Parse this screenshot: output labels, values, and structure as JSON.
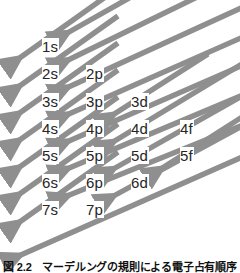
{
  "figure": {
    "title_caption": "図 2.2　マーデルングの規則による電子占有順序",
    "arrow_color": "#8f8f8f",
    "label_color": "#262626",
    "background_color": "#ffffff"
  },
  "chart_data": {
    "type": "diagram",
    "columns": [
      "s",
      "p",
      "d",
      "f"
    ],
    "rows": [
      1,
      2,
      3,
      4,
      5,
      6,
      7
    ],
    "orbitals": [
      {
        "label": "1s",
        "n": 1,
        "l": "s",
        "col": 0,
        "row": 0,
        "x": 42,
        "y": 38
      },
      {
        "label": "2s",
        "n": 2,
        "l": "s",
        "col": 0,
        "row": 1,
        "x": 42,
        "y": 65
      },
      {
        "label": "2p",
        "n": 2,
        "l": "p",
        "col": 1,
        "row": 1,
        "x": 86,
        "y": 65
      },
      {
        "label": "3s",
        "n": 3,
        "l": "s",
        "col": 0,
        "row": 2,
        "x": 42,
        "y": 93
      },
      {
        "label": "3p",
        "n": 3,
        "l": "p",
        "col": 1,
        "row": 2,
        "x": 86,
        "y": 93
      },
      {
        "label": "3d",
        "n": 3,
        "l": "d",
        "col": 2,
        "row": 2,
        "x": 131,
        "y": 93
      },
      {
        "label": "4s",
        "n": 4,
        "l": "s",
        "col": 0,
        "row": 3,
        "x": 42,
        "y": 120
      },
      {
        "label": "4p",
        "n": 4,
        "l": "p",
        "col": 1,
        "row": 3,
        "x": 86,
        "y": 120
      },
      {
        "label": "4d",
        "n": 4,
        "l": "d",
        "col": 2,
        "row": 3,
        "x": 131,
        "y": 120
      },
      {
        "label": "4f",
        "n": 4,
        "l": "f",
        "col": 3,
        "row": 3,
        "x": 180,
        "y": 120
      },
      {
        "label": "5s",
        "n": 5,
        "l": "s",
        "col": 0,
        "row": 4,
        "x": 42,
        "y": 147
      },
      {
        "label": "5p",
        "n": 5,
        "l": "p",
        "col": 1,
        "row": 4,
        "x": 86,
        "y": 147
      },
      {
        "label": "5d",
        "n": 5,
        "l": "d",
        "col": 2,
        "row": 4,
        "x": 131,
        "y": 147
      },
      {
        "label": "5f",
        "n": 5,
        "l": "f",
        "col": 3,
        "row": 4,
        "x": 180,
        "y": 147
      },
      {
        "label": "6s",
        "n": 6,
        "l": "s",
        "col": 0,
        "row": 5,
        "x": 42,
        "y": 174
      },
      {
        "label": "6p",
        "n": 6,
        "l": "p",
        "col": 1,
        "row": 5,
        "x": 86,
        "y": 174
      },
      {
        "label": "6d",
        "n": 6,
        "l": "d",
        "col": 2,
        "row": 5,
        "x": 131,
        "y": 174
      },
      {
        "label": "7s",
        "n": 7,
        "l": "s",
        "col": 0,
        "row": 6,
        "x": 42,
        "y": 201
      },
      {
        "label": "7p",
        "n": 7,
        "l": "p",
        "col": 1,
        "row": 6,
        "x": 86,
        "y": 201
      }
    ],
    "arrows": [
      {
        "name": "arrow-1s",
        "x1": 200,
        "y1": -42,
        "x2": 62,
        "y2": 36
      },
      {
        "name": "arrow-2s",
        "x1": 118,
        "y1": -12,
        "x2": 14,
        "y2": 62
      },
      {
        "name": "arrow-2p-2s",
        "x1": 228,
        "y1": -18,
        "x2": 62,
        "y2": 63
      },
      {
        "name": "arrow-3s",
        "x1": 118,
        "y1": 16,
        "x2": 14,
        "y2": 90
      },
      {
        "name": "arrow-3p",
        "x1": 250,
        "y1": 4,
        "x2": 62,
        "y2": 90
      },
      {
        "name": "arrow-4s",
        "x1": 118,
        "y1": 43,
        "x2": 14,
        "y2": 117
      },
      {
        "name": "arrow-4p",
        "x1": 250,
        "y1": 34,
        "x2": 62,
        "y2": 117
      },
      {
        "name": "arrow-3d-row",
        "x1": 208,
        "y1": 54,
        "x2": 108,
        "y2": 118
      },
      {
        "name": "arrow-5s",
        "x1": 118,
        "y1": 70,
        "x2": 14,
        "y2": 144
      },
      {
        "name": "arrow-5p",
        "x1": 250,
        "y1": 62,
        "x2": 62,
        "y2": 144
      },
      {
        "name": "arrow-4d-row",
        "x1": 242,
        "y1": 64,
        "x2": 108,
        "y2": 145
      },
      {
        "name": "arrow-6s",
        "x1": 118,
        "y1": 97,
        "x2": 14,
        "y2": 171
      },
      {
        "name": "arrow-6p",
        "x1": 250,
        "y1": 92,
        "x2": 62,
        "y2": 171
      },
      {
        "name": "arrow-5d-row",
        "x1": 242,
        "y1": 96,
        "x2": 108,
        "y2": 172
      },
      {
        "name": "arrow-4f-row",
        "x1": 250,
        "y1": 112,
        "x2": 156,
        "y2": 172
      },
      {
        "name": "arrow-7s",
        "x1": 118,
        "y1": 124,
        "x2": 14,
        "y2": 198
      },
      {
        "name": "arrow-7p",
        "x1": 250,
        "y1": 122,
        "x2": 62,
        "y2": 198
      },
      {
        "name": "arrow-6d-row",
        "x1": 242,
        "y1": 126,
        "x2": 108,
        "y2": 199
      },
      {
        "name": "arrow-8s",
        "x1": 118,
        "y1": 152,
        "x2": 14,
        "y2": 226
      },
      {
        "name": "arrow-bottom-long",
        "x1": 258,
        "y1": 150,
        "x2": 14,
        "y2": 258
      }
    ]
  }
}
